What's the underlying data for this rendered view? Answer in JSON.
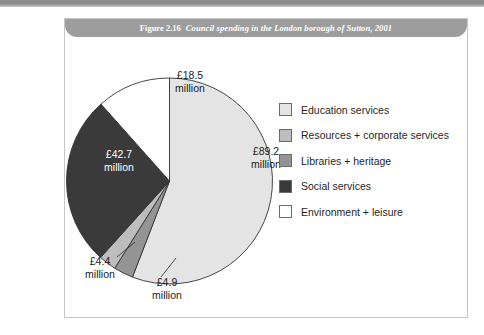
{
  "top_rule": {
    "present": true
  },
  "figure": {
    "number": "Figure 2.16",
    "title": "Council spending in the London borough of Sutton, 2001"
  },
  "legend": {
    "items": [
      {
        "label": "Education services",
        "color": "#e4e4e4"
      },
      {
        "label": "Resources + corporate services",
        "color": "#bdbdbd"
      },
      {
        "label": "Libraries + heritage",
        "color": "#949494"
      },
      {
        "label": "Social services",
        "color": "#3a3a3a"
      },
      {
        "label": "Environment + leisure",
        "color": "#ffffff"
      }
    ]
  },
  "chart_data": {
    "type": "pie",
    "title": "Council spending in the London borough of Sutton, 2001",
    "unit": "£ million",
    "total": 159.7,
    "legend_position": "right",
    "start_angle_deg": 0,
    "direction": "clockwise",
    "categories": [
      "Education services",
      "Libraries + heritage",
      "Resources + corporate services",
      "Social services",
      "Environment + leisure"
    ],
    "values": [
      89.2,
      4.9,
      4.4,
      42.7,
      18.5
    ],
    "labels": [
      "£89.2 million",
      "£4.9 million",
      "£4.4 million",
      "£42.7 million",
      "£18.5 million"
    ],
    "colors": [
      "#e4e4e4",
      "#949494",
      "#bdbdbd",
      "#3a3a3a",
      "#ffffff"
    ],
    "slices": [
      {
        "name": "Education services",
        "value": 89.2,
        "value_text": "£89.2",
        "unit_text": "million",
        "color": "#e4e4e4",
        "label_x": 201,
        "label_y": 118,
        "label_class": "onwhite",
        "leader": false
      },
      {
        "name": "Libraries + heritage",
        "value": 4.9,
        "value_text": "£4.9",
        "unit_text": "million",
        "color": "#949494",
        "label_x": 102,
        "label_y": 249,
        "label_class": "onwhite",
        "leader": true,
        "leader_path": "M 96 240 L 111 221"
      },
      {
        "name": "Resources + corporate services",
        "value": 4.4,
        "value_text": "£4.4",
        "unit_text": "million",
        "color": "#bdbdbd",
        "label_x": 35,
        "label_y": 228,
        "label_class": "onwhite",
        "leader": true,
        "leader_path": "M 52 220 L 70 205"
      },
      {
        "name": "Social services",
        "value": 42.7,
        "value_text": "£42.7",
        "unit_text": "million",
        "color": "#3a3a3a",
        "label_x": 54,
        "label_y": 121,
        "label_class": "ondark",
        "leader": false
      },
      {
        "name": "Environment + leisure",
        "value": 18.5,
        "value_text": "£18.5",
        "unit_text": "million",
        "color": "#ffffff",
        "label_x": 125,
        "label_y": 42,
        "label_class": "onwhite",
        "leader": false
      }
    ]
  }
}
